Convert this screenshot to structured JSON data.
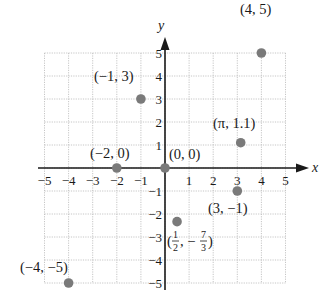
{
  "chart_data": {
    "type": "scatter",
    "title": "",
    "xlabel": "x",
    "ylabel": "y",
    "xlim": [
      -5,
      5
    ],
    "ylim": [
      -5,
      5
    ],
    "grid": true,
    "grid_style": "dotted",
    "x_ticks": [
      -5,
      -4,
      -3,
      -2,
      -1,
      1,
      2,
      3,
      4,
      5
    ],
    "y_ticks": [
      -5,
      -4,
      -3,
      -2,
      -1,
      1,
      2,
      3,
      4,
      5
    ],
    "x_tick_labels": [
      "−5",
      "−4",
      "−3",
      "−2",
      "−1",
      "1",
      "2",
      "3",
      "4",
      "5"
    ],
    "y_tick_labels": [
      "−5",
      "−4",
      "−3",
      "−2",
      "−1",
      "1",
      "2",
      "3",
      "4",
      "5"
    ],
    "point_color": "#7a7a7a",
    "points": [
      {
        "x": 4,
        "y": 5,
        "label": "(4, 5)"
      },
      {
        "x": -1,
        "y": 3,
        "label": "(−1, 3)"
      },
      {
        "x": 3.14159,
        "y": 1.1,
        "label": "(π, 1.1)"
      },
      {
        "x": -2,
        "y": 0,
        "label": "(−2, 0)"
      },
      {
        "x": 0,
        "y": 0,
        "label": "(0, 0)"
      },
      {
        "x": 3,
        "y": -1,
        "label": "(3, −1)"
      },
      {
        "x": 0.5,
        "y": -2.3333,
        "label": "(1/2, −7/3)"
      },
      {
        "x": -4,
        "y": -5,
        "label": "(−4, −5)"
      }
    ]
  },
  "labels": {
    "x_axis": "x",
    "y_axis": "y",
    "p_4_5": "(4, 5)",
    "p_m1_3": "(−1, 3)",
    "p_pi": "(π, 1.1)",
    "p_m2_0": "(−2, 0)",
    "p_0_0": "(0, 0)",
    "p_3_m1": "(3, −1)",
    "p_half_open": "(",
    "p_half_num": "1",
    "p_half_den": "2",
    "p_half_sep": ", −",
    "p_half_num2": "7",
    "p_half_den2": "3",
    "p_half_close": ")",
    "p_m4_m5": "(−4, −5)"
  }
}
